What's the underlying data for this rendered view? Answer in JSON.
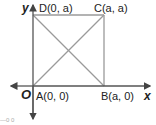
{
  "diagram": {
    "type": "coordinate-geometry-square",
    "axes": {
      "x_label": "x",
      "y_label": "y",
      "origin_label": "O"
    },
    "points": [
      {
        "id": "A",
        "label": "A(0, 0)",
        "coords": [
          0,
          0
        ]
      },
      {
        "id": "B",
        "label": "B(a, 0)",
        "coords": [
          "a",
          0
        ]
      },
      {
        "id": "C",
        "label": "C(a, a)",
        "coords": [
          "a",
          "a"
        ]
      },
      {
        "id": "D",
        "label": "D(0, a)",
        "coords": [
          0,
          "a"
        ]
      }
    ],
    "segments": [
      "AB",
      "BC",
      "CD",
      "DA",
      "AC",
      "BD"
    ],
    "colors": {
      "shape": "#999999",
      "axes": "#555555",
      "text": "#222222"
    },
    "footer_fragment": "—0 0"
  }
}
